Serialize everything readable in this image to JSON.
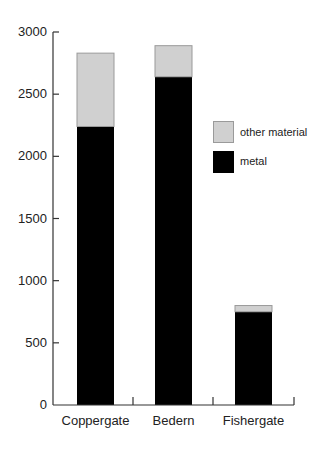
{
  "chart_data": {
    "type": "bar",
    "stacked": true,
    "title": "",
    "xlabel": "",
    "ylabel": "",
    "categories": [
      "Coppergate",
      "Bedern",
      "Fishergate"
    ],
    "series": [
      {
        "name": "metal",
        "color": "#000000",
        "values": [
          2240,
          2640,
          750
        ]
      },
      {
        "name": "other material",
        "color": "#d0d0d0",
        "values": [
          590,
          250,
          50
        ]
      }
    ],
    "totals": [
      2830,
      2890,
      800
    ],
    "ylim": [
      0,
      3000
    ],
    "yticks": [
      0,
      500,
      1000,
      1500,
      2000,
      2500,
      3000
    ],
    "ytick_labels": [
      "0",
      "500",
      "1000",
      "1500",
      "2000",
      "2500",
      "3000"
    ],
    "grid": false,
    "legend": {
      "position": "right, upper-middle inside plot",
      "entries": [
        {
          "label": "other material",
          "color": "#d0d0d0"
        },
        {
          "label": "metal",
          "color": "#000000"
        }
      ]
    }
  }
}
